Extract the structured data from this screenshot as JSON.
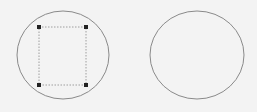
{
  "shapes": [
    {
      "id": "circle-selected",
      "type": "ellipse",
      "cx": 63,
      "cy": 55,
      "rx": 46,
      "ry": 44,
      "stroke": "#8a8a8a",
      "selected": true,
      "selection_box": {
        "x": 39,
        "y": 27,
        "w": 47,
        "h": 58
      },
      "handle_color": "#222222"
    },
    {
      "id": "circle-plain",
      "type": "ellipse",
      "cx": 197,
      "cy": 55,
      "rx": 47,
      "ry": 44,
      "stroke": "#8a8a8a",
      "selected": false
    }
  ],
  "background": "#f3f3f3"
}
